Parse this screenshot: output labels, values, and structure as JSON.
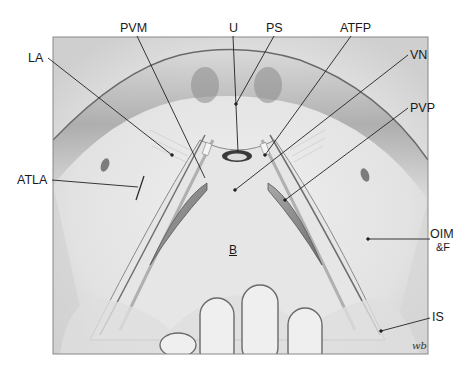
{
  "figure": {
    "type": "anatomical illustration",
    "signature": "wb",
    "labels": [
      {
        "id": "LA",
        "text": "LA",
        "x": 28,
        "y": 52,
        "line": [
          48,
          58,
          172,
          155
        ]
      },
      {
        "id": "PVM",
        "text": "PVM",
        "x": 120,
        "y": 23,
        "line": [
          137,
          36,
          205,
          178
        ]
      },
      {
        "id": "U",
        "text": "U",
        "x": 229,
        "y": 23,
        "line": [
          233,
          36,
          238,
          152
        ]
      },
      {
        "id": "PS",
        "text": "PS",
        "x": 266,
        "y": 23,
        "line": [
          274,
          36,
          236,
          104
        ]
      },
      {
        "id": "ATFP",
        "text": "ATFP",
        "x": 340,
        "y": 23,
        "line": [
          351,
          36,
          265,
          155
        ]
      },
      {
        "id": "VN",
        "text": "VN",
        "x": 410,
        "y": 48,
        "line": [
          408,
          55,
          235,
          190
        ]
      },
      {
        "id": "PVP",
        "text": "PVP",
        "x": 410,
        "y": 101,
        "line": [
          408,
          108,
          285,
          200
        ]
      },
      {
        "id": "ATLA",
        "text": "ATLA",
        "x": 18,
        "y": 174,
        "line": [
          52,
          180,
          142,
          187
        ]
      },
      {
        "id": "OIM",
        "text": "OIM",
        "x": 430,
        "y": 228,
        "line": [
          368,
          239,
          430,
          239
        ]
      },
      {
        "id": "F",
        "text": "&F",
        "x": 436,
        "y": 242,
        "line": null
      },
      {
        "id": "IS",
        "text": "IS",
        "x": 432,
        "y": 311,
        "line": [
          381,
          331,
          430,
          318
        ]
      },
      {
        "id": "B",
        "text": "B",
        "x": 229,
        "y": 243,
        "line": null
      }
    ]
  },
  "colors": {
    "frame": "#888888",
    "tissue_light": "#e9e9e9",
    "tissue_mid": "#c8c8c8",
    "tissue_dark": "#7a7a7a",
    "line": "#222222"
  }
}
